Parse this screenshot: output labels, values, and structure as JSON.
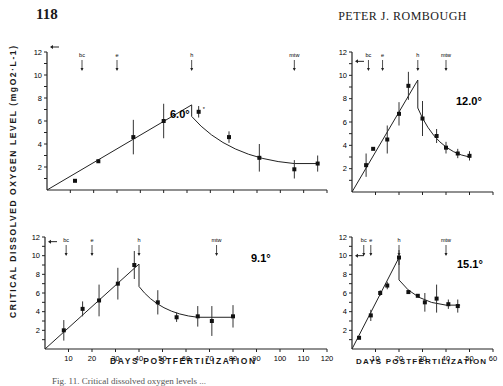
{
  "page": {
    "number": "118",
    "running_head": "PETER J. ROMBOUGH",
    "ylabel": "CRITICAL DISSOLVED OXYGEN LEVEL (mgO2·L-1)",
    "xlabel": "DAYS POSTFERTILIZATION",
    "caption": "Fig. 11. Critical dissolved oxygen levels ..."
  },
  "chart_data": [
    {
      "type": "scatter",
      "title": "6.0°",
      "xlabel": "DAYS POSTFERTILIZATION",
      "ylabel": "CRITICAL DISSOLVED OXYGEN LEVEL (mgO2·L-1)",
      "xlim": [
        0,
        120
      ],
      "ylim": [
        0,
        12
      ],
      "yticks": [
        2,
        4,
        6,
        8,
        10,
        12
      ],
      "xticks": [
        10,
        20,
        30,
        40,
        50,
        60,
        70,
        80,
        90,
        100,
        110,
        120
      ],
      "annotations": [
        {
          "label": "bc",
          "x": 15
        },
        {
          "label": "e",
          "x": 30
        },
        {
          "label": "h",
          "x": 62
        },
        {
          "label": "mtw",
          "x": 106
        }
      ],
      "reference_arrow_y": 12,
      "points": [
        {
          "x": 12,
          "y": 0.8,
          "err": 0
        },
        {
          "x": 22,
          "y": 2.5,
          "err": 0
        },
        {
          "x": 37,
          "y": 4.6,
          "err": 1.5
        },
        {
          "x": 50,
          "y": 6.0,
          "err": 1.5
        },
        {
          "x": 65,
          "y": 6.8,
          "err": 0.5,
          "note": "*"
        },
        {
          "x": 78,
          "y": 4.6,
          "err": 0.5
        },
        {
          "x": 91,
          "y": 2.8,
          "err": 1.2
        },
        {
          "x": 106,
          "y": 1.8,
          "err": 0.8
        },
        {
          "x": 116,
          "y": 2.3,
          "err": 0.7
        }
      ],
      "fit_line": {
        "rise": [
          [
            0,
            0
          ],
          [
            62,
            7.4
          ]
        ],
        "drop_to": 6.4,
        "decay_to": [
          [
            106,
            2.3
          ],
          [
            116,
            2.3
          ]
        ]
      }
    },
    {
      "type": "scatter",
      "title": "12.0°",
      "xlim": [
        0,
        60
      ],
      "ylim": [
        0,
        12
      ],
      "yticks": [
        2,
        4,
        6,
        8,
        10,
        12
      ],
      "xticks": [
        10,
        20,
        30,
        40,
        50,
        60
      ],
      "annotations": [
        {
          "label": "bc",
          "x": 7
        },
        {
          "label": "e",
          "x": 13
        },
        {
          "label": "h",
          "x": 28
        },
        {
          "label": "mtw",
          "x": 40
        }
      ],
      "reference_arrow_y": 11.2,
      "points": [
        {
          "x": 6,
          "y": 2.3,
          "err": 1.0
        },
        {
          "x": 9,
          "y": 3.7,
          "err": 0
        },
        {
          "x": 15,
          "y": 4.5,
          "err": 1.2
        },
        {
          "x": 20,
          "y": 6.7,
          "err": 1.0
        },
        {
          "x": 24,
          "y": 9.1,
          "err": 1.2
        },
        {
          "x": 30,
          "y": 6.3,
          "err": 1.5
        },
        {
          "x": 36,
          "y": 4.8,
          "err": 0.6
        },
        {
          "x": 40,
          "y": 3.8,
          "err": 0.5
        },
        {
          "x": 45,
          "y": 3.3,
          "err": 0.4
        },
        {
          "x": 50,
          "y": 3.1,
          "err": 0.4
        }
      ],
      "fit_line": {
        "rise": [
          [
            0,
            0
          ],
          [
            28,
            9.6
          ]
        ],
        "drop_to": 7.2,
        "decay_to": [
          [
            50,
            3.0
          ]
        ]
      }
    },
    {
      "type": "scatter",
      "title": "9.1°",
      "xlim": [
        0,
        120
      ],
      "ylim": [
        0,
        12
      ],
      "yticks": [
        2,
        4,
        6,
        8,
        10,
        12
      ],
      "xticks": [
        10,
        20,
        30,
        40,
        50,
        60,
        70,
        80,
        90,
        100,
        110,
        120
      ],
      "annotations": [
        {
          "label": "bc",
          "x": 9
        },
        {
          "label": "e",
          "x": 20
        },
        {
          "label": "h",
          "x": 40
        },
        {
          "label": "mtw",
          "x": 73
        }
      ],
      "reference_arrow_y": 11.5,
      "points": [
        {
          "x": 8,
          "y": 2.0,
          "err": 1.1
        },
        {
          "x": 16,
          "y": 4.3,
          "err": 0.8
        },
        {
          "x": 23,
          "y": 5.2,
          "err": 1.7
        },
        {
          "x": 31,
          "y": 7.0,
          "err": 1.7
        },
        {
          "x": 38,
          "y": 9.0,
          "err": 1.5
        },
        {
          "x": 48,
          "y": 5.0,
          "err": 1.3
        },
        {
          "x": 56,
          "y": 3.4,
          "err": 0.5
        },
        {
          "x": 65,
          "y": 3.5,
          "err": 1.1
        },
        {
          "x": 71,
          "y": 3.0,
          "err": 1.6
        },
        {
          "x": 80,
          "y": 3.5,
          "err": 1.2
        }
      ],
      "fit_line": {
        "rise": [
          [
            0,
            0
          ],
          [
            40,
            9.1
          ]
        ],
        "drop_to": 6.7,
        "decay_to": [
          [
            65,
            3.4
          ],
          [
            80,
            3.4
          ]
        ]
      }
    },
    {
      "type": "scatter",
      "title": "15.1°",
      "xlim": [
        0,
        60
      ],
      "ylim": [
        0,
        12
      ],
      "yticks": [
        2,
        4,
        6,
        8,
        10,
        12
      ],
      "xticks": [
        10,
        20,
        30,
        40,
        50,
        60
      ],
      "annotations": [
        {
          "label": "bc",
          "x": 5
        },
        {
          "label": "e",
          "x": 8
        },
        {
          "label": "h",
          "x": 20
        },
        {
          "label": "mtw",
          "x": 40
        }
      ],
      "reference_arrow_y": 10,
      "points": [
        {
          "x": 3,
          "y": 1.2,
          "err": 0
        },
        {
          "x": 8,
          "y": 3.6,
          "err": 0.6
        },
        {
          "x": 12,
          "y": 6.0,
          "err": 0.3
        },
        {
          "x": 15,
          "y": 6.8,
          "err": 0.4
        },
        {
          "x": 20,
          "y": 9.8,
          "err": 0.8
        },
        {
          "x": 24,
          "y": 6.1,
          "err": 0
        },
        {
          "x": 28,
          "y": 5.7,
          "err": 0
        },
        {
          "x": 31,
          "y": 5.0,
          "err": 1.0
        },
        {
          "x": 36,
          "y": 5.4,
          "err": 1.5
        },
        {
          "x": 41,
          "y": 4.8,
          "err": 0.5
        },
        {
          "x": 45,
          "y": 4.6,
          "err": 0.7
        }
      ],
      "fit_line": {
        "rise": [
          [
            0,
            0
          ],
          [
            20,
            9.8
          ]
        ],
        "drop_to": 7.4,
        "decay_to": [
          [
            40,
            4.7
          ],
          [
            46,
            4.7
          ]
        ]
      }
    }
  ]
}
